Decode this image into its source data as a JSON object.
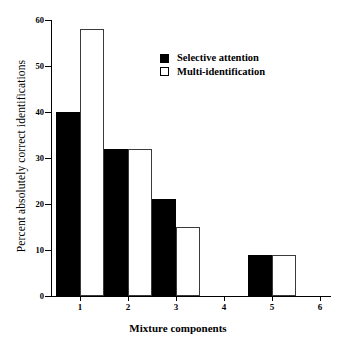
{
  "chart_data": {
    "type": "bar",
    "title": "",
    "xlabel": "Mixture components",
    "ylabel": "Percent absolutely correct identifications",
    "categories": [
      "1",
      "2",
      "3",
      "4",
      "5",
      "6"
    ],
    "series": [
      {
        "name": "Selective attention",
        "values": [
          40,
          32,
          21,
          0,
          9,
          0
        ],
        "color": "#000000",
        "fill": "solid"
      },
      {
        "name": "Multi-identification",
        "values": [
          58,
          32,
          15,
          0,
          9,
          0
        ],
        "color": "#ffffff",
        "fill": "open"
      }
    ],
    "ylim": [
      0,
      60
    ],
    "yticks": [
      0,
      10,
      20,
      30,
      40,
      50,
      60
    ],
    "ytick_labels": [
      "0",
      "10",
      "20",
      "30",
      "40",
      "50",
      "60"
    ],
    "xtick_labels": [
      "1",
      "2",
      "3",
      "4",
      "5",
      "6"
    ],
    "grid": false,
    "legend_position": "top-center-right"
  },
  "legend": {
    "items": [
      {
        "label": "Selective attention",
        "marker": "filled-square-icon"
      },
      {
        "label": "Multi-identification",
        "marker": "open-square-icon"
      }
    ]
  }
}
